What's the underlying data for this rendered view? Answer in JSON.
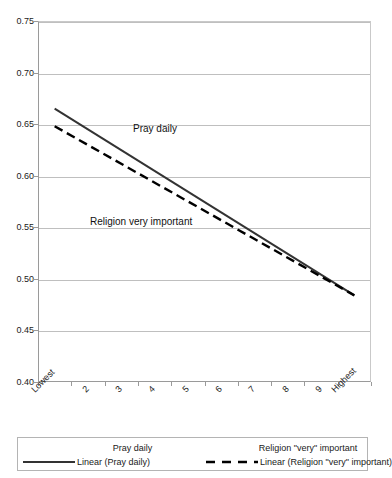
{
  "chart_data": {
    "type": "line",
    "title": "",
    "xlabel": "",
    "ylabel": "",
    "categories": [
      "Lowest",
      "2",
      "3",
      "4",
      "5",
      "6",
      "7",
      "8",
      "9",
      "Highest"
    ],
    "ylim": [
      0.4,
      0.75
    ],
    "ytick_labels": [
      "0.75",
      "0.70",
      "0.65",
      "0.60",
      "0.55",
      "0.50",
      "0.45",
      "0.40"
    ],
    "ytick_values": [
      0.75,
      0.7,
      0.65,
      0.6,
      0.55,
      0.5,
      0.45,
      0.4
    ],
    "grid": true,
    "legend_position": "bottom",
    "series": [
      {
        "name": "Pray daily",
        "style": "solid",
        "color": "#333333",
        "values": [
          0.665,
          0.645,
          0.625,
          0.605,
          0.585,
          0.565,
          0.545,
          0.525,
          0.504,
          0.484
        ]
      },
      {
        "name": "Religion \"very\" important",
        "style": "dashed",
        "color": "#000000",
        "values": [
          0.648,
          0.63,
          0.612,
          0.594,
          0.575,
          0.557,
          0.539,
          0.521,
          0.503,
          0.484
        ]
      }
    ],
    "annotations": [
      {
        "text": "Pray daily"
      },
      {
        "text": "Religion very important"
      }
    ]
  },
  "axes": {
    "y_ticks": [
      {
        "label": "0.75"
      },
      {
        "label": "0.70"
      },
      {
        "label": "0.65"
      },
      {
        "label": "0.60"
      },
      {
        "label": "0.55"
      },
      {
        "label": "0.50"
      },
      {
        "label": "0.45"
      },
      {
        "label": "0.40"
      }
    ],
    "x_ticks": [
      {
        "label": "Lowest"
      },
      {
        "label": "2"
      },
      {
        "label": "3"
      },
      {
        "label": "4"
      },
      {
        "label": "5"
      },
      {
        "label": "6"
      },
      {
        "label": "7"
      },
      {
        "label": "8"
      },
      {
        "label": "9"
      },
      {
        "label": "Highest"
      }
    ]
  },
  "annotations": {
    "pray_daily": "Pray daily",
    "religion_very_important": "Religion very important"
  },
  "legend": {
    "entries": [
      {
        "label": "Pray daily",
        "key": "none"
      },
      {
        "label": "Religion \"very\" important",
        "key": "none"
      },
      {
        "label": "Linear (Pray daily)",
        "key": "solid"
      },
      {
        "label": "Linear (Religion \"very\" important)",
        "key": "dashed"
      }
    ]
  },
  "colors": {
    "series_solid": "#333333",
    "series_dashed": "#000000",
    "gridline": "#bfbfbf",
    "axis": "#9a9a9a",
    "legend_border": "#b4b4b4",
    "background": "#ffffff"
  }
}
